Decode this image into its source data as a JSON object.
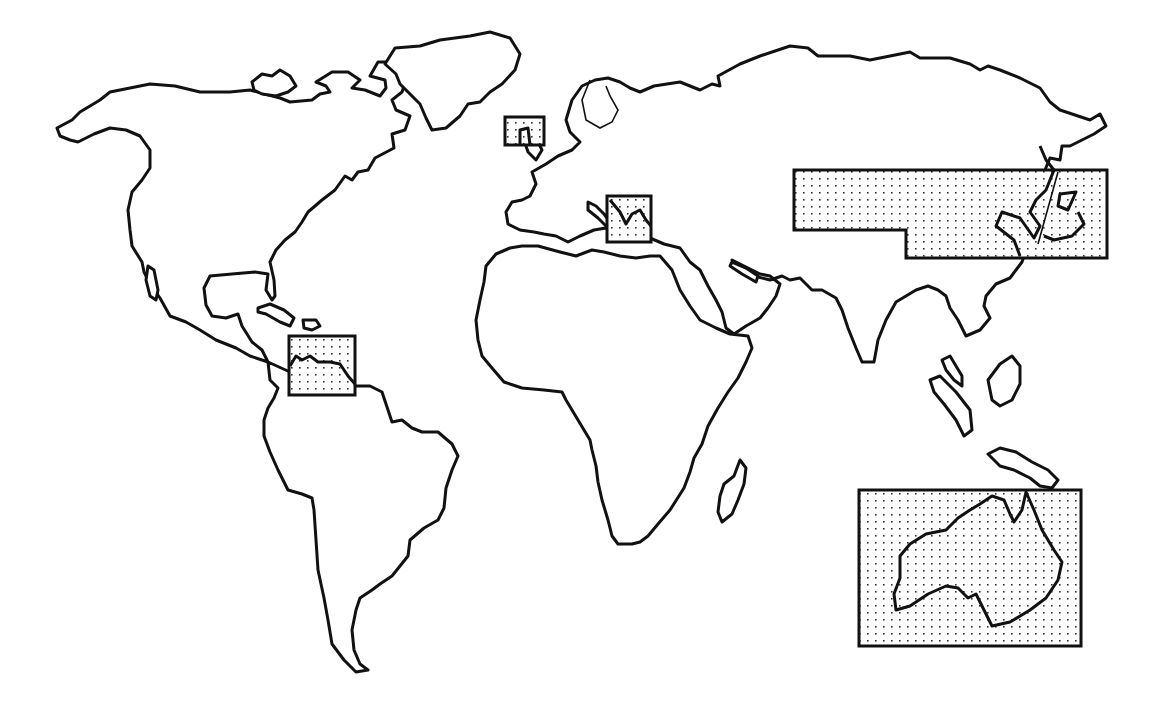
{
  "map": {
    "type": "world-outline",
    "style": "black outline on white, stippled highlight boxes",
    "colors": {
      "outline": "#111111",
      "background": "#ffffff",
      "stipple": "#333333"
    },
    "continents": [
      "north-america",
      "greenland",
      "south-america",
      "europe",
      "africa",
      "asia",
      "australia",
      "madagascar",
      "japan",
      "new-guinea",
      "borneo",
      "sumatra",
      "caribbean-islands",
      "british-isles"
    ],
    "highlighted_regions": [
      {
        "id": "caribbean-venezuela",
        "bbox": [
          289,
          336,
          355,
          395
        ]
      },
      {
        "id": "british-isles",
        "bbox": [
          505,
          117,
          544,
          145
        ]
      },
      {
        "id": "eastern-mediterranean",
        "bbox": [
          607,
          196,
          651,
          242
        ]
      },
      {
        "id": "east-asia",
        "bbox": [
          794,
          170,
          1107,
          258
        ]
      },
      {
        "id": "australia",
        "bbox": [
          859,
          490,
          1081,
          646
        ]
      }
    ]
  }
}
